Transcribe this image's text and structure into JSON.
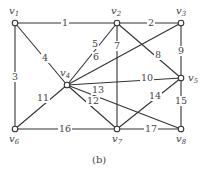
{
  "caption": "(b)",
  "nodes": [
    {
      "id": "v1",
      "label": "v1",
      "x": 15,
      "y": 23,
      "lx": 9,
      "ly": 14
    },
    {
      "id": "v2",
      "label": "v2",
      "x": 117,
      "y": 23,
      "lx": 111,
      "ly": 14
    },
    {
      "id": "v3",
      "label": "v3",
      "x": 181,
      "y": 23,
      "lx": 176,
      "ly": 14
    },
    {
      "id": "v4",
      "label": "v4",
      "x": 67,
      "y": 85,
      "lx": 60,
      "ly": 76
    },
    {
      "id": "v5",
      "label": "v5",
      "x": 181,
      "y": 78,
      "lx": 188,
      "ly": 81
    },
    {
      "id": "v6",
      "label": "v6",
      "x": 15,
      "y": 129,
      "lx": 9,
      "ly": 142
    },
    {
      "id": "v7",
      "label": "v7",
      "x": 117,
      "y": 129,
      "lx": 112,
      "ly": 142
    },
    {
      "id": "v8",
      "label": "v8",
      "x": 181,
      "y": 129,
      "lx": 176,
      "ly": 142
    }
  ],
  "edges": [
    {
      "label": "1",
      "from": "v1",
      "to": "v2",
      "lx": 62,
      "ly": 26
    },
    {
      "label": "2",
      "from": "v2",
      "to": "v3",
      "lx": 148,
      "ly": 26
    },
    {
      "label": "3",
      "from": "v1",
      "to": "v6",
      "lx": 12,
      "ly": 80
    },
    {
      "label": "4",
      "from": "v1",
      "to": "v4",
      "lx": 42,
      "ly": 61
    },
    {
      "label": "5",
      "from": "v4",
      "to": "v2",
      "lx": 92,
      "ly": 47
    },
    {
      "label": "6",
      "from": "v4",
      "to": "v3",
      "lx": 93,
      "ly": 60
    },
    {
      "label": "7",
      "from": "v2",
      "to": "v7",
      "lx": 114,
      "ly": 49
    },
    {
      "label": "8",
      "from": "v2",
      "to": "v5",
      "lx": 155,
      "ly": 58
    },
    {
      "label": "9",
      "from": "v3",
      "to": "v5",
      "lx": 178,
      "ly": 54
    },
    {
      "label": "10",
      "from": "v4",
      "to": "v5",
      "lx": 141,
      "ly": 81
    },
    {
      "label": "11",
      "from": "v4",
      "to": "v6",
      "lx": 37,
      "ly": 101
    },
    {
      "label": "12",
      "from": "v4",
      "to": "v7",
      "lx": 87,
      "ly": 104
    },
    {
      "label": "13",
      "from": "v4",
      "to": "v8",
      "lx": 92,
      "ly": 93
    },
    {
      "label": "14",
      "from": "v7",
      "to": "v5",
      "lx": 149,
      "ly": 99
    },
    {
      "label": "15",
      "from": "v5",
      "to": "v8",
      "lx": 175,
      "ly": 104
    },
    {
      "label": "16",
      "from": "v6",
      "to": "v7",
      "lx": 59,
      "ly": 132
    },
    {
      "label": "17",
      "from": "v7",
      "to": "v8",
      "lx": 145,
      "ly": 132
    }
  ]
}
